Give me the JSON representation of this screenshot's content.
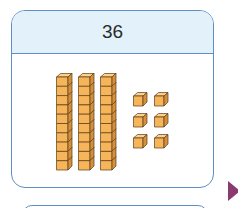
{
  "card": {
    "number": "36",
    "tens": 3,
    "ones": 6,
    "cubes_per_rod": 10
  },
  "colors": {
    "border": "#5d8fc4",
    "header_bg": "#e3f2fa",
    "cube_front": "#f7b55a",
    "cube_top": "#fbd08a",
    "cube_side": "#d4913a",
    "cube_outline": "#5a3a1a",
    "arrow": "#8a3a6e"
  },
  "icons": {
    "next": "triangle-right"
  }
}
